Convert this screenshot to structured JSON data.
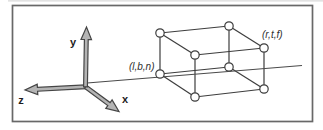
{
  "figure": {
    "description_labels": {
      "near_corner": "(l,b,n)",
      "far_corner": "(r,t,f)"
    },
    "colors": {
      "background": "#ffffff",
      "frame_stroke": "#686868",
      "hairline": "#d9d9d9",
      "line": "#3d3d3d",
      "ray": "#4a4a4a",
      "vertex_fill": "#ffffff",
      "arrow_fill": "#b4b4b4",
      "arrow_stroke": "#454545",
      "label": "#1d1d1d"
    },
    "frame": {
      "x": 12.5,
      "y": 5.5,
      "w": 300,
      "h": 116
    },
    "hairline": {
      "x1": 8,
      "y1": 0.8,
      "x2": 323,
      "y2": 0.8
    },
    "ray": {
      "x1": 87,
      "y1": 83,
      "x2": 302,
      "y2": 65.5
    },
    "axes": {
      "origin": [
        85.5,
        86.8
      ],
      "shaft_width": 3.8,
      "head_width": 10.5,
      "head_length": 12.5,
      "items": [
        {
          "id": "z-axis",
          "label": "z",
          "tip": [
            25,
            90
          ],
          "label_x": 21,
          "label_y": 103.5
        },
        {
          "id": "x-axis",
          "label": "x",
          "tip": [
            119,
            111.5
          ],
          "label_x": 125,
          "label_y": 102.5
        },
        {
          "id": "y-axis",
          "label": "y",
          "tip": [
            86.5,
            27
          ],
          "label_x": 73,
          "label_y": 45.5
        }
      ]
    },
    "box": {
      "vertex_radius": 4.2,
      "vertices": {
        "A": [
          160,
          33
        ],
        "B": [
          229,
          26
        ],
        "C": [
          195,
          55
        ],
        "D": [
          264,
          48
        ],
        "E": [
          160,
          74
        ],
        "F": [
          229,
          67
        ],
        "G": [
          195,
          97
        ],
        "H": [
          264,
          89
        ]
      },
      "edges": [
        [
          "A",
          "B"
        ],
        [
          "B",
          "D"
        ],
        [
          "D",
          "C"
        ],
        [
          "C",
          "A"
        ],
        [
          "E",
          "F"
        ],
        [
          "F",
          "H"
        ],
        [
          "H",
          "G"
        ],
        [
          "G",
          "E"
        ],
        [
          "A",
          "E"
        ],
        [
          "B",
          "F"
        ],
        [
          "C",
          "G"
        ],
        [
          "D",
          "H"
        ]
      ],
      "corner_labels": [
        {
          "text": "(l,b,n)",
          "x": 154.5,
          "y": 70,
          "anchor": "end"
        },
        {
          "text": "(r,t,f)",
          "x": 262,
          "y": 38,
          "anchor": "start"
        }
      ]
    }
  }
}
